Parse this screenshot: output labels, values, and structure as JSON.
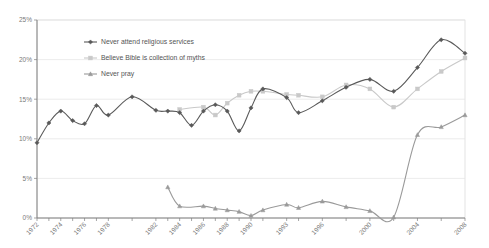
{
  "chart_data": {
    "type": "line",
    "title": "",
    "subtitle": "",
    "xlabel": "",
    "ylabel": "",
    "ylim": [
      0,
      25
    ],
    "y_tick_labels": [
      "0%",
      "5%",
      "10%",
      "15%",
      "20%",
      "25%"
    ],
    "y_ticks": [
      0,
      5,
      10,
      15,
      20,
      25
    ],
    "grid": true,
    "grid_axis": "y",
    "legend_position": "top-left-inside",
    "x_tick_labels": [
      "1972",
      "1974",
      "1976",
      "1978",
      "1982",
      "1984",
      "1986",
      "1988",
      "1990",
      "1993",
      "1996",
      "2000",
      "2004",
      "2008"
    ],
    "x": [
      1972,
      1973,
      1974,
      1975,
      1976,
      1977,
      1978,
      1980,
      1982,
      1983,
      1984,
      1985,
      1986,
      1987,
      1988,
      1989,
      1990,
      1991,
      1993,
      1994,
      1996,
      1998,
      2000,
      2002,
      2004,
      2006,
      2008
    ],
    "xlim": [
      1972,
      2008
    ],
    "series": [
      {
        "name": "Never attend religious services",
        "color": "#595959",
        "marker": "diamond",
        "values": [
          9.5,
          12.0,
          13.5,
          12.3,
          11.9,
          14.2,
          13.0,
          15.3,
          13.6,
          13.5,
          13.3,
          11.7,
          13.5,
          14.3,
          13.5,
          11.0,
          13.9,
          16.3,
          15.2,
          13.3,
          14.8,
          16.5,
          17.5,
          16.0,
          19.0,
          22.5,
          20.8
        ]
      },
      {
        "name": "Believe Bible is collection of myths",
        "color": "#c9c9c9",
        "marker": "square",
        "values": [
          null,
          null,
          null,
          null,
          null,
          null,
          null,
          null,
          null,
          null,
          13.7,
          null,
          14.0,
          13.0,
          14.5,
          15.5,
          16.0,
          16.0,
          15.6,
          15.5,
          15.3,
          16.8,
          16.3,
          14.0,
          16.3,
          18.5,
          20.2
        ]
      },
      {
        "name": "Never pray",
        "color": "#9a9a9a",
        "marker": "triangle",
        "values": [
          null,
          null,
          null,
          null,
          null,
          null,
          null,
          null,
          null,
          3.9,
          1.5,
          null,
          1.5,
          1.2,
          1.0,
          0.8,
          0.3,
          1.0,
          1.7,
          1.3,
          2.1,
          1.4,
          0.9,
          0.1,
          10.5,
          11.5,
          13.0
        ]
      }
    ],
    "series_detail": {
      "never_attend": {
        "points": [
          {
            "x": 1972,
            "y": 9.5
          },
          {
            "x": 1973,
            "y": 12.0
          },
          {
            "x": 1974,
            "y": 13.5
          },
          {
            "x": 1975,
            "y": 12.3
          },
          {
            "x": 1976,
            "y": 11.9
          },
          {
            "x": 1977,
            "y": 14.2
          },
          {
            "x": 1978,
            "y": 13.0
          },
          {
            "x": 1980,
            "y": 15.3
          },
          {
            "x": 1982,
            "y": 13.6
          },
          {
            "x": 1983,
            "y": 13.5
          },
          {
            "x": 1984,
            "y": 13.3
          },
          {
            "x": 1985,
            "y": 11.7
          },
          {
            "x": 1986,
            "y": 13.5
          },
          {
            "x": 1987,
            "y": 14.3
          },
          {
            "x": 1988,
            "y": 13.5
          },
          {
            "x": 1989,
            "y": 11.0
          },
          {
            "x": 1990,
            "y": 13.9
          },
          {
            "x": 1991,
            "y": 16.3
          },
          {
            "x": 1993,
            "y": 15.2
          },
          {
            "x": 1994,
            "y": 13.3
          },
          {
            "x": 1996,
            "y": 14.8
          },
          {
            "x": 1998,
            "y": 16.5
          },
          {
            "x": 2000,
            "y": 17.5
          },
          {
            "x": 2002,
            "y": 16.0
          },
          {
            "x": 2004,
            "y": 19.0
          },
          {
            "x": 2006,
            "y": 22.5
          },
          {
            "x": 2008,
            "y": 20.8
          }
        ]
      },
      "bible_myths": {
        "points": [
          {
            "x": 1984,
            "y": 13.7
          },
          {
            "x": 1986,
            "y": 14.0
          },
          {
            "x": 1987,
            "y": 13.0
          },
          {
            "x": 1988,
            "y": 14.5
          },
          {
            "x": 1989,
            "y": 15.5
          },
          {
            "x": 1990,
            "y": 16.0
          },
          {
            "x": 1991,
            "y": 16.0
          },
          {
            "x": 1993,
            "y": 15.6
          },
          {
            "x": 1994,
            "y": 15.5
          },
          {
            "x": 1996,
            "y": 15.3
          },
          {
            "x": 1998,
            "y": 16.8
          },
          {
            "x": 2000,
            "y": 16.3
          },
          {
            "x": 2002,
            "y": 14.0
          },
          {
            "x": 2004,
            "y": 16.3
          },
          {
            "x": 2006,
            "y": 18.5
          },
          {
            "x": 2008,
            "y": 20.2
          }
        ]
      },
      "never_pray": {
        "points": [
          {
            "x": 1983,
            "y": 3.9
          },
          {
            "x": 1984,
            "y": 1.5
          },
          {
            "x": 1986,
            "y": 1.5
          },
          {
            "x": 1987,
            "y": 1.2
          },
          {
            "x": 1988,
            "y": 1.0
          },
          {
            "x": 1989,
            "y": 0.8
          },
          {
            "x": 1990,
            "y": 0.3
          },
          {
            "x": 1991,
            "y": 1.0
          },
          {
            "x": 1993,
            "y": 1.7
          },
          {
            "x": 1994,
            "y": 1.3
          },
          {
            "x": 1996,
            "y": 2.1
          },
          {
            "x": 1998,
            "y": 1.4
          },
          {
            "x": 2000,
            "y": 0.9
          },
          {
            "x": 2002,
            "y": 0.1
          },
          {
            "x": 2004,
            "y": 10.5
          },
          {
            "x": 2006,
            "y": 11.5
          },
          {
            "x": 2008,
            "y": 13.0
          }
        ]
      }
    }
  },
  "legend": {
    "items": [
      {
        "label": "Never attend religious services",
        "color": "#595959",
        "marker": "diamond"
      },
      {
        "label": "Believe Bible is collection of myths",
        "color": "#c9c9c9",
        "marker": "square"
      },
      {
        "label": "Never pray",
        "color": "#9a9a9a",
        "marker": "triangle"
      }
    ]
  },
  "colors": {
    "axis": "#808080",
    "grid": "#e4e4e4",
    "plot_border": "#d8d8d8",
    "background": "#ffffff"
  }
}
